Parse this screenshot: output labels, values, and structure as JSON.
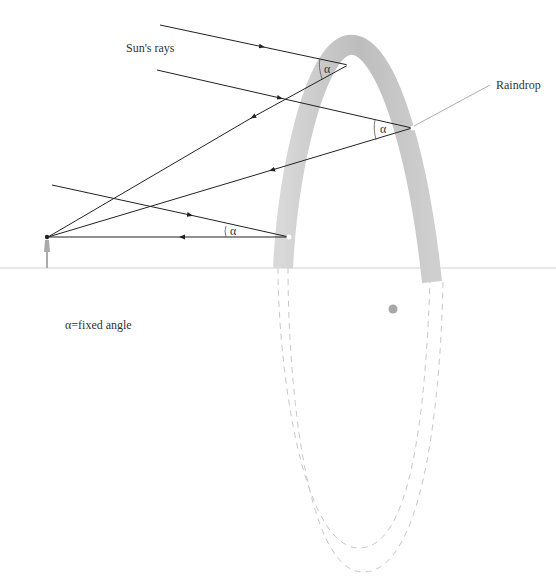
{
  "labels": {
    "sun_rays": "Sun's rays",
    "raindrop": "Raindrop",
    "legend": "α=fixed angle",
    "angle_symbol": "α"
  },
  "colors": {
    "ray": "#222222",
    "rainbow_arc": "#b8b8b8",
    "horizon": "#e6e6e6",
    "dashed_circle": "#c8c8c8",
    "center_dot": "#a8a8a8",
    "leader_line": "#999999",
    "viewer": "#aaaaaa"
  },
  "rays": [
    {
      "incoming": {
        "from": [
          160,
          25
        ],
        "to": [
          348,
          65
        ]
      },
      "reflected_to_viewer": [
        48,
        237
      ]
    },
    {
      "incoming": {
        "from": [
          157,
          70
        ],
        "to": [
          412,
          128
        ]
      },
      "reflected_to_viewer": [
        48,
        237
      ]
    },
    {
      "incoming": {
        "from": [
          52,
          185
        ],
        "to": [
          289,
          237
        ]
      },
      "reflected_to_viewer": [
        48,
        237
      ]
    }
  ]
}
